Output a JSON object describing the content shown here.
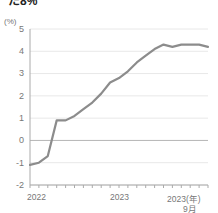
{
  "headline": "た8%",
  "axis": {
    "unit_label": "(%)",
    "y_ticks": [
      "5",
      "4",
      "3",
      "2",
      "1",
      "0",
      "-1",
      "-2"
    ],
    "x_ticks": [
      "2022",
      "2023",
      "2023(年)"
    ],
    "x_sub": "9月"
  },
  "colors": {
    "line": "#8c8c8c",
    "grid": "#e8e8e8",
    "zero_line": "#b5b5b5",
    "axis": "#aaaaaa",
    "text": "#777777",
    "headline": "#222222"
  },
  "chart_data": {
    "type": "line",
    "title": "た8%",
    "xlabel": "",
    "ylabel": "(%)",
    "unit": "%",
    "ylim": [
      -2,
      5
    ],
    "grid": true,
    "legend_position": "none",
    "x_tick_labels": [
      "2022",
      "2023",
      "2023(年) 9月"
    ],
    "x": [
      "2022-01",
      "2022-02",
      "2022-03",
      "2022-04",
      "2022-05",
      "2022-06",
      "2022-07",
      "2022-08",
      "2022-09",
      "2022-10",
      "2022-11",
      "2022-12",
      "2023-01",
      "2023-02",
      "2023-03",
      "2023-04",
      "2023-05",
      "2023-06",
      "2023-07",
      "2023-08",
      "2023-09"
    ],
    "series": [
      {
        "name": "消費者物価指数 前年同月比",
        "values": [
          -1.1,
          -1.0,
          -0.7,
          0.9,
          0.9,
          1.1,
          1.4,
          1.7,
          2.1,
          2.6,
          2.8,
          3.1,
          3.5,
          3.8,
          4.1,
          4.3,
          4.2,
          4.3,
          4.3,
          4.3,
          4.2
        ]
      }
    ]
  }
}
